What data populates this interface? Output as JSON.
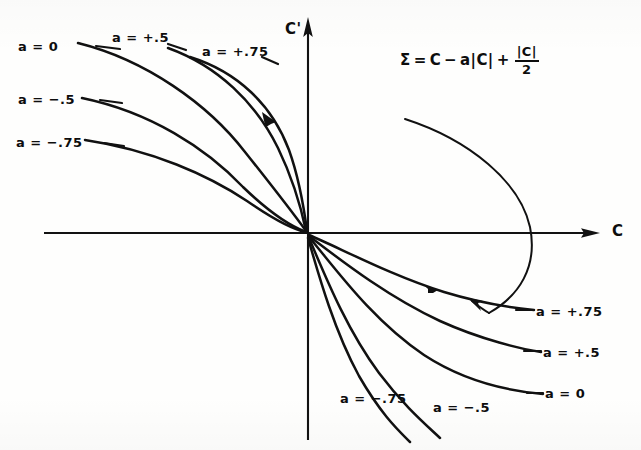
{
  "figure": {
    "background_color": "#fefefd",
    "ink_color": "#111111"
  },
  "axes": {
    "x_label": "C",
    "y_label": "C'",
    "x_axis_y": 233,
    "y_axis_x": 308,
    "x_range_px": [
      42,
      600
    ],
    "y_range_px": [
      18,
      442
    ]
  },
  "equation": {
    "lhs": "Σ",
    "eq": "=",
    "term1": "C",
    "minus": "−",
    "term2": "a|C|",
    "plus": "+",
    "frac_numerator": "|C|",
    "frac_denominator": "2",
    "plain_text": "Σ = C − a|C| + |C|/2"
  },
  "curve_labels_upper_left": [
    {
      "text": "a = 0",
      "x": 18,
      "y": 40
    },
    {
      "text": "a = −.5",
      "x": 18,
      "y": 93
    },
    {
      "text": "a = −.75",
      "x": 16,
      "y": 136
    }
  ],
  "curve_labels_upper_mid": [
    {
      "text": "a = +.5",
      "x": 112,
      "y": 31
    },
    {
      "text": "a = +.75",
      "x": 202,
      "y": 45
    }
  ],
  "curve_labels_lower_right": [
    {
      "text": "a = +.75",
      "x": 536,
      "y": 311
    },
    {
      "text": "a = +.5",
      "x": 543,
      "y": 352
    },
    {
      "text": "a = 0",
      "x": 545,
      "y": 393
    }
  ],
  "curve_labels_lower_mid": [
    {
      "text": "a = −.75",
      "x": 340,
      "y": 398
    },
    {
      "text": "a = −.5",
      "x": 433,
      "y": 407
    }
  ],
  "chart_data": {
    "type": "line",
    "title": "",
    "xlabel": "C",
    "ylabel": "C'",
    "grid": false,
    "legend": "inline-curve-labels",
    "origin_px": [
      308,
      233
    ],
    "series": [
      {
        "name": "a = 0",
        "branch": "upper-left",
        "label_side": "left"
      },
      {
        "name": "a = -.5",
        "branch": "upper-left",
        "label_side": "left"
      },
      {
        "name": "a = -.75",
        "branch": "upper-left",
        "label_side": "left"
      },
      {
        "name": "a = +.5",
        "branch": "upper-left",
        "label_side": "top"
      },
      {
        "name": "a = +.75",
        "branch": "upper-left",
        "label_side": "top"
      },
      {
        "name": "a = +.75",
        "branch": "lower-right",
        "label_side": "right"
      },
      {
        "name": "a = +.5",
        "branch": "lower-right",
        "label_side": "right"
      },
      {
        "name": "a = 0",
        "branch": "lower-right",
        "label_side": "right"
      },
      {
        "name": "a = -.75",
        "branch": "lower-right",
        "label_side": "bottom"
      },
      {
        "name": "a = -.5",
        "branch": "lower-right",
        "label_side": "bottom"
      },
      {
        "name": "separatrix",
        "branch": "parabola-right",
        "label_side": "none"
      }
    ]
  }
}
